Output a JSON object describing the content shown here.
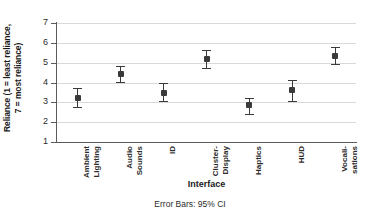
{
  "chart_data": {
    "type": "scatter",
    "title": "",
    "subtitle": "",
    "xlabel": "Interface",
    "ylabel": "Reliance (1 = least reliance,\n7 = most reliance)",
    "ylabel_line1": "Reliance (1 = least reliance,",
    "ylabel_line2": "7 = most reliance)",
    "annotation": "Error Bars: 95% CI",
    "ylim": [
      1,
      7
    ],
    "yticks": [
      1,
      2,
      3,
      4,
      5,
      6,
      7
    ],
    "ytick_labels": [
      "1",
      "2",
      "3",
      "4",
      "5",
      "6",
      "7"
    ],
    "grid": true,
    "gridlines_at": [
      2,
      3,
      4,
      5,
      6,
      7
    ],
    "legend": null,
    "legend_position": "none",
    "error_bar_type": "95% CI",
    "marker_color": "#3a3a3a",
    "grid_color": "#d9d9d9",
    "axis_color": "#5b5b5b",
    "categories": [
      "Ambient\nLighting",
      "Audio\nSounds",
      "ID",
      "Cluster-\nDisplay",
      "Haptics",
      "HUD",
      "Vocali-\nsations"
    ],
    "values": [
      3.22,
      4.44,
      3.48,
      5.18,
      2.85,
      3.6,
      5.35
    ],
    "ci_lower": [
      2.75,
      4.02,
      3.05,
      4.72,
      2.42,
      3.05,
      4.95
    ],
    "ci_upper": [
      3.72,
      4.85,
      4.0,
      5.62,
      3.2,
      4.15,
      5.78
    ],
    "points": [
      {
        "category": "Ambient Lighting",
        "mean": 3.22,
        "ci_lower": 2.75,
        "ci_upper": 3.72
      },
      {
        "category": "Audio Sounds",
        "mean": 4.44,
        "ci_lower": 4.02,
        "ci_upper": 4.85
      },
      {
        "category": "ID",
        "mean": 3.48,
        "ci_lower": 3.05,
        "ci_upper": 4.0
      },
      {
        "category": "Cluster-Display",
        "mean": 5.18,
        "ci_lower": 4.72,
        "ci_upper": 5.62
      },
      {
        "category": "Haptics",
        "mean": 2.85,
        "ci_lower": 2.42,
        "ci_upper": 3.2
      },
      {
        "category": "HUD",
        "mean": 3.6,
        "ci_lower": 3.05,
        "ci_upper": 4.15
      },
      {
        "category": "Vocalisations",
        "mean": 5.35,
        "ci_lower": 4.95,
        "ci_upper": 5.78
      }
    ]
  }
}
